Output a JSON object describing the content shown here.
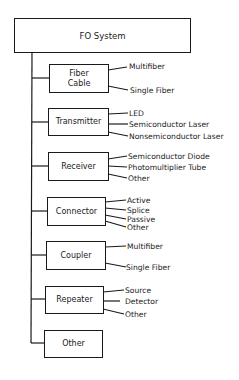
{
  "diagram": {
    "root": {
      "label": "FO System"
    },
    "components": [
      {
        "label": "Fiber\nCable",
        "label_line1": "Fiber",
        "label_line2": "Cable",
        "children": [
          "Multifiber",
          "Single Fiber"
        ]
      },
      {
        "label": "Transmitter",
        "children": [
          "LED",
          "Semiconductor Laser",
          "Nonsemiconductor Laser"
        ]
      },
      {
        "label": "Receiver",
        "children": [
          "Semiconductor Diode",
          "Photomultiplier Tube",
          "Other"
        ]
      },
      {
        "label": "Connector",
        "children": [
          "Active",
          "Splice",
          "Passive",
          "Other"
        ]
      },
      {
        "label": "Coupler",
        "children": [
          "Multifiber",
          "Single Fiber"
        ]
      },
      {
        "label": "Repeater",
        "children": [
          "Source",
          "Detector",
          "Other"
        ]
      },
      {
        "label": "Other",
        "children": []
      }
    ],
    "colors": {
      "line": "#1a1a1a",
      "background": "#ffffff"
    }
  }
}
